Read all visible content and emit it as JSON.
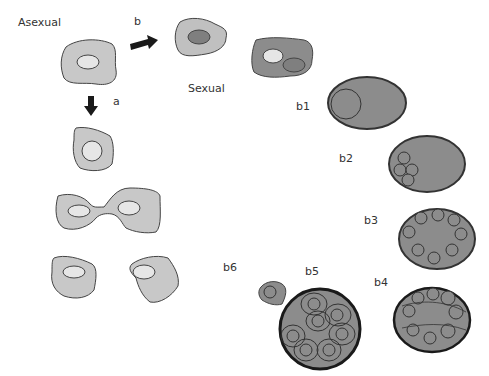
{
  "diagram": {
    "type": "cell-division-diagram",
    "colors": {
      "cytoplasm_light": "#c8c8c8",
      "cytoplasm_dark": "#8c8c8c",
      "nucleus_light": "#e6e6e6",
      "nucleus_dark": "#7f7f7f",
      "outline": "#444444",
      "cyst_wall": "#222222",
      "arrow": "#1a1a1a"
    },
    "labels": {
      "asexual": "Asexual",
      "sexual": "Sexual",
      "a": "a",
      "b": "b",
      "b1": "b1",
      "b2": "b2",
      "b3": "b3",
      "b4": "b4",
      "b5": "b5",
      "b6": "b6"
    },
    "pathways": [
      {
        "id": "a",
        "name": "Asexual",
        "stages": [
          "trophozoite",
          "rounding",
          "binary-fission",
          "two-daughter-cells"
        ]
      },
      {
        "id": "b",
        "name": "Sexual",
        "stages": [
          "gamont",
          "gamont-pair",
          "b1",
          "b2",
          "b3",
          "b4",
          "b5",
          "b6"
        ]
      }
    ],
    "nuclei_counts": {
      "b1": 1,
      "b2": 4,
      "b3": 8,
      "b4": 8,
      "b5": 8,
      "b6": 1
    }
  }
}
